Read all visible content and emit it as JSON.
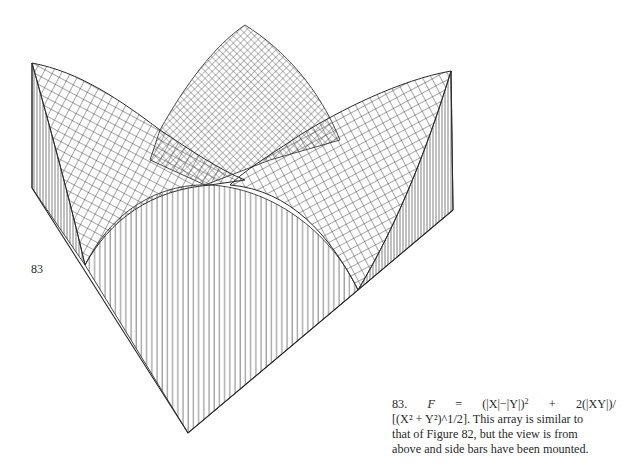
{
  "figure": {
    "number": "83",
    "label": "83",
    "type": "3D surface wireframe (perspective view from above, with side bars mounted)",
    "formula": "F = (|X|−|Y|)² + 2(|XY|)/[(X² + Y²)^(1/2)]",
    "colors": {
      "ink": "#2a2a2a",
      "mesh": "#3a3a3a",
      "bars": "#555555",
      "background": "#ffffff"
    }
  },
  "caption": {
    "number": "83.",
    "line1_parts": [
      "F",
      "=",
      "(|X|−|Y|)",
      "+",
      "2(|XY|)/"
    ],
    "line2": "[(X² + Y²)^1/2]. This array is similar to",
    "line3": "that of Figure 82, but the view is from",
    "line4": "above and side bars have been mounted.",
    "full_text": "83. F = (|X|−|Y|)² + 2(|XY|)/[(X² + Y²)^1/2]. This array is similar to that of Figure 82, but the view is from above and side bars have been mounted."
  },
  "geometry": {
    "left_peak": [
      32,
      63
    ],
    "center_peak": [
      245,
      25
    ],
    "right_peak": [
      451,
      71
    ],
    "left_corner_low": [
      32,
      188
    ],
    "right_corner_low": [
      453,
      210
    ],
    "bottom_vertex": [
      188,
      433
    ],
    "front_arch": {
      "left": [
        85,
        265
      ],
      "top": [
        210,
        185
      ],
      "right": [
        358,
        290
      ]
    }
  }
}
